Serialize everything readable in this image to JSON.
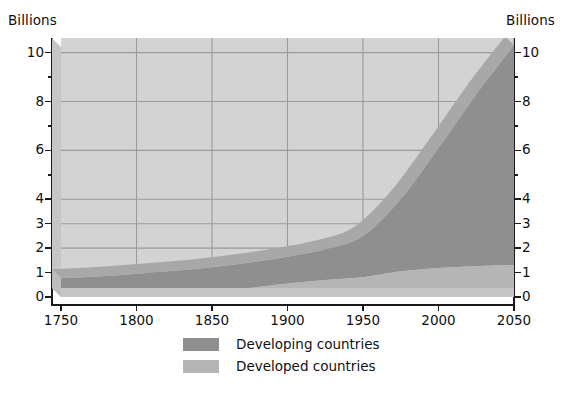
{
  "axis_titles": {
    "left": "Billions",
    "right": "Billions"
  },
  "legend": {
    "items": [
      {
        "label": "Developing countries",
        "color": "#8f8f8f"
      },
      {
        "label": "Developed countries",
        "color": "#b5b5b5"
      }
    ]
  },
  "chart_data": {
    "type": "area",
    "stacked": true,
    "title": "",
    "subtitle": "",
    "xlabel": "",
    "ylabel": "Billions",
    "y2label": "Billions",
    "xlim": [
      1750,
      2050
    ],
    "ylim": [
      0,
      10.6
    ],
    "xticks": [
      1750,
      1800,
      1850,
      1900,
      1950,
      2000,
      2050
    ],
    "xticklabels": [
      "1750",
      "1800",
      "1850",
      "1900",
      "1950",
      "2000",
      "2050"
    ],
    "yticks": [
      0,
      1,
      2,
      3,
      4,
      6,
      8,
      10
    ],
    "yticklabels": [
      "0",
      "1",
      "2",
      "3",
      "4",
      "6",
      "8",
      "10"
    ],
    "y_unlabeled_ticks": [
      5,
      7,
      9
    ],
    "grid": true,
    "grid_color": "#9a9a9a",
    "plot_background": "#d3d3d3",
    "legend_position": "bottom",
    "x": [
      1750,
      1775,
      1800,
      1825,
      1850,
      1875,
      1900,
      1925,
      1950,
      1975,
      2000,
      2025,
      2050
    ],
    "series": [
      {
        "name": "Developed countries",
        "color": "#b5b5b5",
        "values": [
          0.17,
          0.19,
          0.22,
          0.25,
          0.3,
          0.37,
          0.55,
          0.7,
          0.81,
          1.05,
          1.19,
          1.26,
          1.3
        ]
      },
      {
        "name": "Developing countries",
        "color": "#8f8f8f",
        "values": [
          0.6,
          0.65,
          0.73,
          0.82,
          0.92,
          1.04,
          1.1,
          1.25,
          1.69,
          2.96,
          4.91,
          7.04,
          9.0
        ]
      }
    ],
    "totals": [
      0.77,
      0.84,
      0.95,
      1.07,
      1.22,
      1.41,
      1.65,
      1.95,
      2.5,
      4.01,
      6.1,
      8.3,
      10.3
    ]
  }
}
